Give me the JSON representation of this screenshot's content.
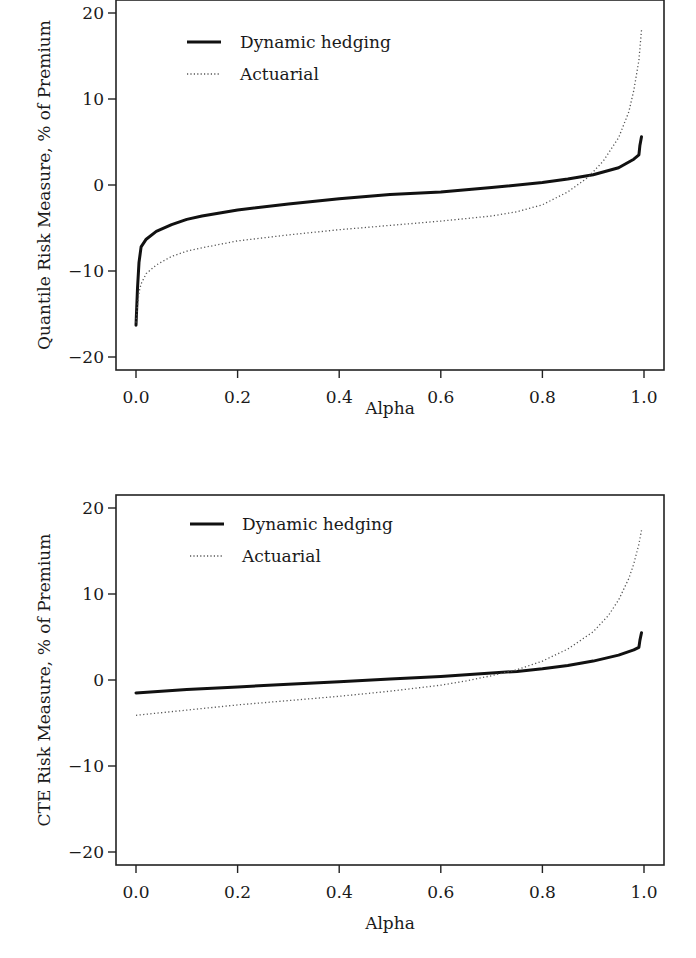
{
  "chart_data": [
    {
      "type": "line",
      "title": "",
      "xlabel": "Alpha",
      "ylabel": "Quantile Risk Measure, % of Premium",
      "xlim": [
        0,
        1
      ],
      "ylim": [
        -20,
        20
      ],
      "xticks": [
        "0.0",
        "0.2",
        "0.4",
        "0.6",
        "0.8",
        "1.0"
      ],
      "xtick_values": [
        0,
        0.2,
        0.4,
        0.6,
        0.8,
        1.0
      ],
      "yticks": [
        "20",
        "10",
        "0",
        "−10",
        "−20"
      ],
      "ytick_values": [
        20,
        10,
        0,
        -10,
        -20
      ],
      "grid": false,
      "legend": "top-left",
      "series": [
        {
          "name": "Dynamic hedging",
          "style": "solid",
          "x": [
            0.0,
            0.003,
            0.006,
            0.01,
            0.02,
            0.04,
            0.07,
            0.1,
            0.13,
            0.2,
            0.3,
            0.4,
            0.5,
            0.6,
            0.7,
            0.8,
            0.85,
            0.9,
            0.95,
            0.98,
            0.99,
            0.992,
            0.995
          ],
          "y": [
            -16.3,
            -12.0,
            -9.0,
            -7.2,
            -6.3,
            -5.4,
            -4.6,
            -4.0,
            -3.6,
            -2.9,
            -2.2,
            -1.6,
            -1.1,
            -0.8,
            -0.3,
            0.3,
            0.7,
            1.2,
            2.0,
            3.0,
            3.5,
            4.6,
            5.6
          ]
        },
        {
          "name": "Actuarial",
          "style": "dotted",
          "x": [
            0.0,
            0.003,
            0.006,
            0.01,
            0.02,
            0.04,
            0.07,
            0.1,
            0.13,
            0.2,
            0.3,
            0.4,
            0.5,
            0.6,
            0.7,
            0.75,
            0.8,
            0.85,
            0.89,
            0.92,
            0.95,
            0.97,
            0.98,
            0.99,
            0.995
          ],
          "y": [
            -16.0,
            -14.0,
            -12.5,
            -11.5,
            -10.3,
            -9.3,
            -8.3,
            -7.7,
            -7.3,
            -6.5,
            -5.8,
            -5.2,
            -4.7,
            -4.2,
            -3.6,
            -3.1,
            -2.3,
            -0.8,
            0.9,
            2.8,
            5.5,
            8.5,
            11.0,
            14.5,
            18.0
          ]
        }
      ]
    },
    {
      "type": "line",
      "title": "",
      "xlabel": "Alpha",
      "ylabel": "CTE Risk Measure, % of Premium",
      "xlim": [
        0,
        1
      ],
      "ylim": [
        -20,
        20
      ],
      "xticks": [
        "0.0",
        "0.2",
        "0.4",
        "0.6",
        "0.8",
        "1.0"
      ],
      "xtick_values": [
        0,
        0.2,
        0.4,
        0.6,
        0.8,
        1.0
      ],
      "yticks": [
        "20",
        "10",
        "0",
        "−10",
        "−20"
      ],
      "ytick_values": [
        20,
        10,
        0,
        -10,
        -20
      ],
      "grid": false,
      "legend": "top-left",
      "series": [
        {
          "name": "Dynamic hedging",
          "style": "solid",
          "x": [
            0.0,
            0.1,
            0.2,
            0.3,
            0.4,
            0.5,
            0.6,
            0.7,
            0.75,
            0.8,
            0.85,
            0.9,
            0.95,
            0.98,
            0.99,
            0.992,
            0.995
          ],
          "y": [
            -1.5,
            -1.1,
            -0.8,
            -0.5,
            -0.2,
            0.1,
            0.4,
            0.8,
            1.0,
            1.3,
            1.7,
            2.2,
            2.9,
            3.5,
            3.8,
            4.6,
            5.5
          ]
        },
        {
          "name": "Actuarial",
          "style": "dotted",
          "x": [
            0.0,
            0.1,
            0.2,
            0.3,
            0.4,
            0.5,
            0.6,
            0.65,
            0.7,
            0.75,
            0.8,
            0.85,
            0.9,
            0.93,
            0.95,
            0.97,
            0.98,
            0.99,
            0.995
          ],
          "y": [
            -4.1,
            -3.5,
            -2.9,
            -2.4,
            -1.9,
            -1.3,
            -0.6,
            -0.1,
            0.5,
            1.2,
            2.2,
            3.6,
            5.6,
            7.5,
            9.3,
            11.8,
            13.5,
            15.8,
            17.4
          ]
        }
      ]
    }
  ]
}
